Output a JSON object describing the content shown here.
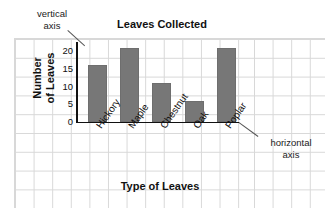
{
  "chart_data": {
    "type": "bar",
    "title": "Leaves Collected",
    "xlabel": "Type of Leaves",
    "ylabel_line1": "Number",
    "ylabel_line2": "of Leaves",
    "ylabel": "Number of Leaves",
    "categories": [
      "Hickory",
      "Maple",
      "Chestnut",
      "Oak",
      "Poplar"
    ],
    "values": [
      16,
      21,
      11,
      6,
      21
    ],
    "yticks": [
      20,
      15,
      10,
      5,
      0
    ],
    "ylim": [
      0,
      22
    ],
    "grid": true,
    "legend": "none",
    "bar_color": "#777777",
    "axis_color": "#111111",
    "grid_color": "#d8d8d8"
  },
  "annotations": {
    "vertical_axis_line1": "vertical",
    "vertical_axis_line2": "axis",
    "horizontal_axis_line1": "horizontal",
    "horizontal_axis_line2": "axis"
  }
}
